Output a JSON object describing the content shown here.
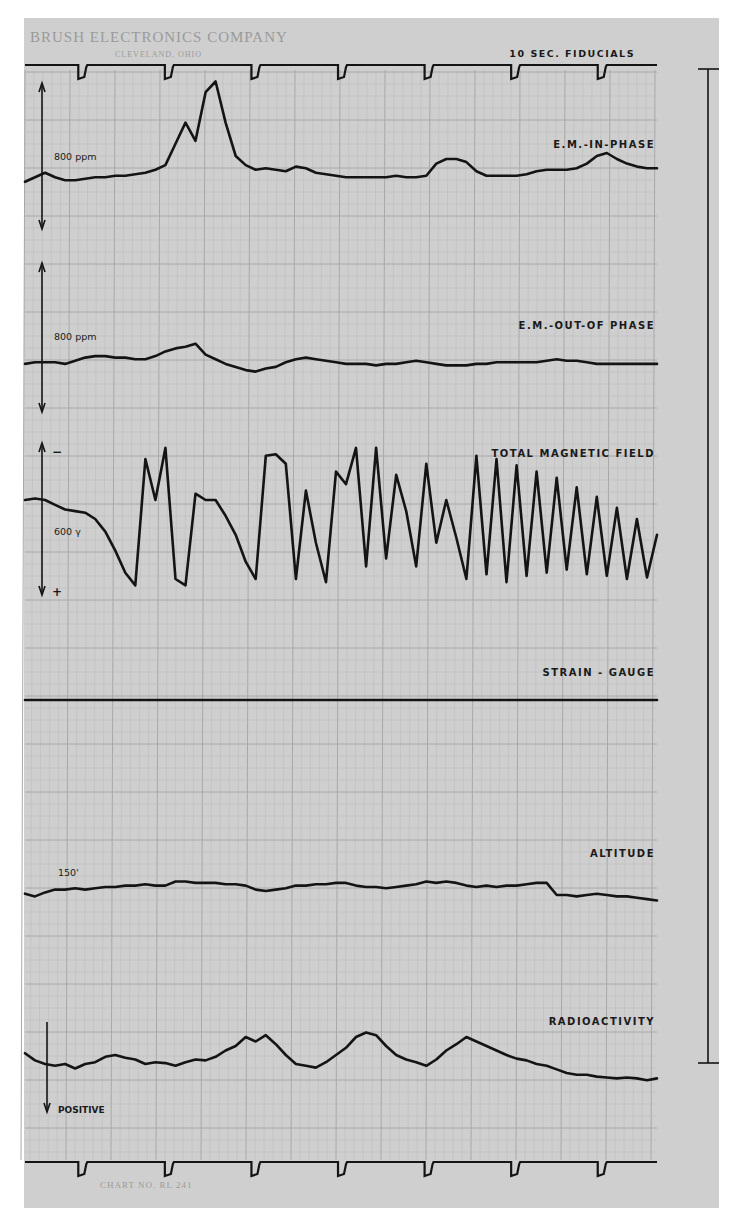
{
  "header": {
    "company": "BRUSH ELECTRONICS COMPANY",
    "city": "CLEVELAND, OHIO",
    "fiducial_label": "10 SEC. FIDUCIALS"
  },
  "footer": {
    "chart_number": "CHART NO. RL 241"
  },
  "colors": {
    "paper": "#cfcfcf",
    "ink": "#141414",
    "grid": "#a8a8a8"
  },
  "chart_data": {
    "type": "line",
    "xlabel": "Time (10 sec. fiducials)",
    "ylabel": "",
    "x_unit": "sample index across strip (0–63)",
    "value_note": "normalized trace level within each channel: 0 = bottom of channel, 1 = top",
    "fiducials": {
      "label": "10 SEC. FIDUCIALS",
      "count_top": 7,
      "count_bottom": 7,
      "interval_seconds": 10
    },
    "grid": true,
    "series": [
      {
        "name": "E.M.-IN-PHASE",
        "scale_label": "800 ppm",
        "scale_marks": [
          "",
          ""
        ],
        "values": [
          0.33,
          0.36,
          0.39,
          0.36,
          0.34,
          0.34,
          0.35,
          0.36,
          0.36,
          0.37,
          0.37,
          0.38,
          0.39,
          0.41,
          0.44,
          0.58,
          0.72,
          0.6,
          0.92,
          0.99,
          0.72,
          0.5,
          0.44,
          0.41,
          0.42,
          0.41,
          0.4,
          0.43,
          0.42,
          0.39,
          0.38,
          0.37,
          0.36,
          0.36,
          0.36,
          0.36,
          0.36,
          0.37,
          0.36,
          0.36,
          0.37,
          0.45,
          0.48,
          0.48,
          0.46,
          0.4,
          0.37,
          0.37,
          0.37,
          0.37,
          0.38,
          0.4,
          0.41,
          0.41,
          0.41,
          0.42,
          0.45,
          0.5,
          0.52,
          0.48,
          0.45,
          0.43,
          0.42,
          0.42
        ]
      },
      {
        "name": "E.M.-OUT-OF PHASE",
        "scale_label": "800 ppm",
        "scale_marks": [
          "",
          ""
        ],
        "values": [
          0.33,
          0.34,
          0.34,
          0.34,
          0.33,
          0.35,
          0.37,
          0.38,
          0.38,
          0.37,
          0.37,
          0.36,
          0.36,
          0.38,
          0.41,
          0.43,
          0.44,
          0.46,
          0.39,
          0.36,
          0.33,
          0.31,
          0.29,
          0.28,
          0.3,
          0.31,
          0.34,
          0.36,
          0.37,
          0.36,
          0.35,
          0.34,
          0.33,
          0.33,
          0.33,
          0.32,
          0.33,
          0.33,
          0.34,
          0.35,
          0.34,
          0.33,
          0.32,
          0.32,
          0.32,
          0.33,
          0.33,
          0.34,
          0.34,
          0.34,
          0.34,
          0.34,
          0.35,
          0.36,
          0.35,
          0.35,
          0.34,
          0.33,
          0.33,
          0.33,
          0.33,
          0.33,
          0.33,
          0.33
        ]
      },
      {
        "name": "TOTAL MAGNETIC FIELD",
        "scale_label": "600 γ",
        "scale_marks": [
          "−",
          "+"
        ],
        "values": [
          0.62,
          0.63,
          0.62,
          0.59,
          0.56,
          0.55,
          0.54,
          0.5,
          0.42,
          0.3,
          0.16,
          0.08,
          0.88,
          0.62,
          0.95,
          0.12,
          0.08,
          0.66,
          0.62,
          0.62,
          0.52,
          0.4,
          0.23,
          0.12,
          0.9,
          0.91,
          0.85,
          0.12,
          0.68,
          0.35,
          0.1,
          0.8,
          0.72,
          0.95,
          0.2,
          0.95,
          0.25,
          0.78,
          0.55,
          0.2,
          0.85,
          0.35,
          0.62,
          0.38,
          0.12,
          0.9,
          0.15,
          0.88,
          0.1,
          0.84,
          0.14,
          0.8,
          0.16,
          0.76,
          0.18,
          0.7,
          0.15,
          0.64,
          0.14,
          0.57,
          0.12,
          0.5,
          0.13,
          0.4
        ]
      },
      {
        "name": "STRAIN - GAUGE",
        "scale_label": "",
        "scale_marks": [
          "",
          ""
        ],
        "values": [
          0.5,
          0.5,
          0.5,
          0.5,
          0.5,
          0.5,
          0.5,
          0.5,
          0.5,
          0.5,
          0.5,
          0.5,
          0.5,
          0.5,
          0.5,
          0.5,
          0.5,
          0.5,
          0.5,
          0.5,
          0.5,
          0.5,
          0.5,
          0.5,
          0.5,
          0.5,
          0.5,
          0.5,
          0.5,
          0.5,
          0.5,
          0.5,
          0.5,
          0.5,
          0.5,
          0.5,
          0.5,
          0.5,
          0.5,
          0.5,
          0.5,
          0.5,
          0.5,
          0.5,
          0.5,
          0.5,
          0.5,
          0.5,
          0.5,
          0.5,
          0.5,
          0.5,
          0.5,
          0.5,
          0.5,
          0.5,
          0.5,
          0.5,
          0.5,
          0.5,
          0.5,
          0.5,
          0.5,
          0.5
        ]
      },
      {
        "name": "ALTITUDE",
        "scale_label": "150'",
        "scale_marks": [
          "",
          ""
        ],
        "values": [
          0.38,
          0.36,
          0.39,
          0.41,
          0.41,
          0.42,
          0.41,
          0.42,
          0.43,
          0.43,
          0.44,
          0.44,
          0.45,
          0.44,
          0.44,
          0.47,
          0.47,
          0.46,
          0.46,
          0.46,
          0.45,
          0.45,
          0.44,
          0.41,
          0.4,
          0.41,
          0.42,
          0.44,
          0.44,
          0.45,
          0.45,
          0.46,
          0.46,
          0.44,
          0.43,
          0.43,
          0.42,
          0.43,
          0.44,
          0.45,
          0.47,
          0.46,
          0.47,
          0.46,
          0.44,
          0.43,
          0.44,
          0.43,
          0.44,
          0.44,
          0.45,
          0.46,
          0.46,
          0.37,
          0.37,
          0.36,
          0.37,
          0.38,
          0.37,
          0.36,
          0.36,
          0.35,
          0.34,
          0.33
        ]
      },
      {
        "name": "RADIOACTIVITY",
        "scale_label": "POSITIVE",
        "scale_marks": [
          "",
          ""
        ],
        "values": [
          0.52,
          0.44,
          0.4,
          0.38,
          0.4,
          0.35,
          0.4,
          0.42,
          0.48,
          0.5,
          0.47,
          0.45,
          0.4,
          0.42,
          0.41,
          0.38,
          0.42,
          0.45,
          0.44,
          0.48,
          0.55,
          0.6,
          0.7,
          0.65,
          0.72,
          0.62,
          0.5,
          0.4,
          0.38,
          0.36,
          0.42,
          0.5,
          0.58,
          0.7,
          0.75,
          0.72,
          0.6,
          0.5,
          0.45,
          0.42,
          0.38,
          0.45,
          0.55,
          0.62,
          0.7,
          0.65,
          0.6,
          0.55,
          0.5,
          0.46,
          0.44,
          0.4,
          0.38,
          0.34,
          0.3,
          0.28,
          0.28,
          0.26,
          0.25,
          0.24,
          0.25,
          0.24,
          0.22,
          0.24
        ]
      }
    ]
  }
}
